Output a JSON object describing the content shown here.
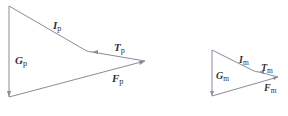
{
  "diagram": {
    "left_triangle": {
      "labels": {
        "I": {
          "main": "I",
          "sub": "p"
        },
        "T": {
          "main": "T",
          "sub": "p"
        },
        "G": {
          "main": "G",
          "sub": "p"
        },
        "F": {
          "main": "F",
          "sub": "p"
        }
      }
    },
    "right_triangle": {
      "labels": {
        "I": {
          "main": "I",
          "sub": "m"
        },
        "T": {
          "main": "T",
          "sub": "m"
        },
        "G": {
          "main": "G",
          "sub": "m"
        },
        "F": {
          "main": "F",
          "sub": "m"
        }
      }
    },
    "colors": {
      "line": "#8a8a9a",
      "text": "#333333"
    }
  }
}
